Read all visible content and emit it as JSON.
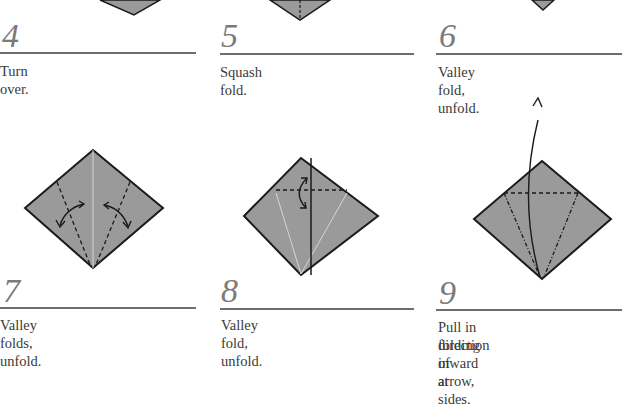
{
  "steps": [
    {
      "number": "4",
      "caption": "Turn over."
    },
    {
      "number": "5",
      "caption": "Squash fold."
    },
    {
      "number": "6",
      "caption": "Valley fold, unfold."
    },
    {
      "number": "7",
      "caption": "Valley folds, unfold."
    },
    {
      "number": "8",
      "caption": "Valley fold, unfold."
    },
    {
      "number": "9",
      "caption_line1": "Pull in direction of arrow,",
      "caption_line2": "folding inward at sides."
    }
  ],
  "colors": {
    "paper": "#9a9a9a",
    "edge": "#1a1a1a",
    "number": "#7a7a7a",
    "rule": "#6e6e6e"
  }
}
